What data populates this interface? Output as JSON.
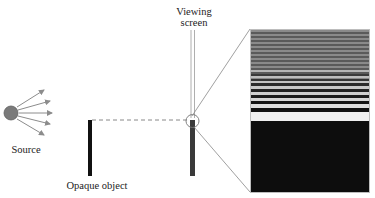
{
  "labels": {
    "source": "Source",
    "opaque_object": "Opaque object",
    "viewing_screen_line1": "Viewing",
    "viewing_screen_line2": "screen"
  },
  "colors": {
    "source_fill": "#7a7a7a",
    "arrow": "#8c8c8c",
    "object": "#111111",
    "screen_bar": "#3a3a3a",
    "dashed_line": "#888888",
    "bright_fringe": "#e8e8e8",
    "dark_shadow": "#0d0d0d"
  },
  "inset": {
    "description": "Enlarged diffraction pattern at shadow edge",
    "fringes": [
      {
        "top": 40,
        "h": 2,
        "c": "#b5b5b5"
      },
      {
        "top": 46,
        "h": 2,
        "c": "#bdbdbd"
      },
      {
        "top": 51,
        "h": 2,
        "c": "#c2c2c2"
      },
      {
        "top": 56,
        "h": 3,
        "c": "#c8c8c8"
      },
      {
        "top": 62,
        "h": 3,
        "c": "#cfcfcf"
      },
      {
        "top": 68,
        "h": 3,
        "c": "#d6d6d6"
      },
      {
        "top": 74,
        "h": 4,
        "c": "#dedede"
      },
      {
        "top": 82,
        "h": 8,
        "c": "#efefef"
      }
    ]
  }
}
